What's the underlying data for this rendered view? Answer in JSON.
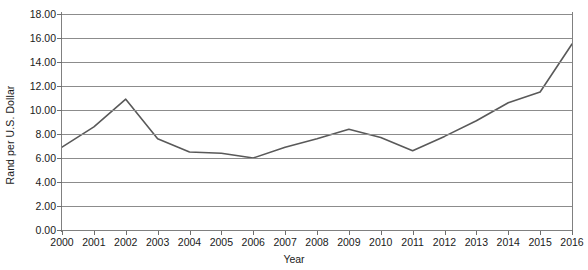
{
  "chart_data": {
    "type": "line",
    "title": "",
    "xlabel": "Year",
    "ylabel": "Rand per U.S. Dollar",
    "categories": [
      "2000",
      "2001",
      "2002",
      "2003",
      "2004",
      "2005",
      "2006",
      "2007",
      "2008",
      "2009",
      "2010",
      "2011",
      "2012",
      "2013",
      "2014",
      "2015",
      "2016"
    ],
    "x": [
      2000,
      2001,
      2002,
      2003,
      2004,
      2005,
      2006,
      2007,
      2008,
      2009,
      2010,
      2011,
      2012,
      2013,
      2014,
      2015,
      2016
    ],
    "values": [
      6.9,
      8.6,
      10.9,
      7.6,
      6.5,
      6.4,
      6.0,
      6.9,
      7.6,
      8.4,
      7.7,
      6.6,
      7.8,
      9.1,
      10.6,
      11.5,
      15.5
    ],
    "series": [
      {
        "name": "Rand per U.S. Dollar",
        "values": [
          6.9,
          8.6,
          10.9,
          7.6,
          6.5,
          6.4,
          6.0,
          6.9,
          7.6,
          8.4,
          7.7,
          6.6,
          7.8,
          9.1,
          10.6,
          11.5,
          15.5
        ]
      }
    ],
    "ylim": [
      0,
      18
    ],
    "ytick_values": [
      0,
      2,
      4,
      6,
      8,
      10,
      12,
      14,
      16,
      18
    ],
    "ytick_labels": [
      "0.00",
      "2.00",
      "4.00",
      "6.00",
      "8.00",
      "10.00",
      "12.00",
      "14.00",
      "16.00",
      "18.00"
    ],
    "xtick_labels": [
      "2000",
      "2001",
      "2002",
      "2003",
      "2004",
      "2005",
      "2006",
      "2007",
      "2008",
      "2009",
      "2010",
      "2011",
      "2012",
      "2013",
      "2014",
      "2015",
      "2016"
    ],
    "grid": true,
    "grid_axis": "y",
    "legend": false,
    "legend_position": "none",
    "line_color": "#595959",
    "grid_color": "#8c8c8c",
    "axis_color": "#808080",
    "background_color": "#ffffff",
    "markers": false
  }
}
